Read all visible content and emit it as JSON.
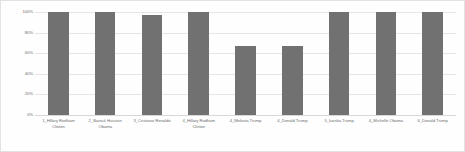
{
  "chart_data": {
    "type": "bar",
    "title": "",
    "xlabel": "",
    "ylabel": "",
    "categories": [
      "1_Hillary Rodham Clinton",
      "2_Barack Hussein Obama",
      "3_Cristiano Renaldo",
      "4_Hillary Rodham Clinton",
      "4_Melania Trump",
      "4_Donald Trump",
      "5_Ivanka Trump",
      "4_Michelle Obama",
      "6_Donald Trump"
    ],
    "values": [
      100,
      100,
      97,
      100,
      67,
      67,
      100,
      100,
      100
    ],
    "ylim": [
      0,
      100
    ],
    "yticks": [
      0,
      20,
      40,
      60,
      80,
      100
    ],
    "ytick_labels": [
      "0%",
      "20%",
      "40%",
      "60%",
      "80%",
      "100%"
    ],
    "grid": true,
    "legend": false,
    "bar_color": "#717171",
    "gridline_color": "#e6e6e6",
    "axis_text_color": "#6f6f6f",
    "background_color": "#fefefe",
    "border_color": "#e2e2e2"
  }
}
